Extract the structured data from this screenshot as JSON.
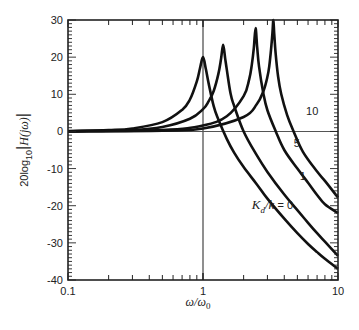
{
  "chart_data": {
    "type": "line",
    "title": "",
    "xlabel": "ω/ω0",
    "ylabel": "20log10|H(jω)|",
    "xscale": "log",
    "xlim": [
      0.1,
      10
    ],
    "ylim": [
      -40,
      30
    ],
    "x_ticks": [
      0.1,
      1,
      10
    ],
    "x_tick_labels": [
      "0.1",
      "1",
      "10"
    ],
    "y_ticks": [
      -40,
      -30,
      -20,
      -10,
      0,
      10,
      20,
      30
    ],
    "y_tick_labels": [
      "-40",
      "-30",
      "-20",
      "-10",
      "0",
      "10",
      "20",
      "30"
    ],
    "grid": false,
    "reference_lines": [
      {
        "orientation": "vertical",
        "x": 1
      },
      {
        "orientation": "horizontal",
        "y": 0
      }
    ],
    "legend": "inline labels",
    "series": [
      {
        "name": "Kd/k = 0",
        "label": "K_d/k = 0",
        "x": [
          0.1,
          0.2,
          0.3,
          0.5,
          0.7,
          0.8,
          0.9,
          0.95,
          1.0,
          1.05,
          1.1,
          1.2,
          1.3,
          1.5,
          1.7,
          2,
          2.5,
          3,
          4,
          5,
          6,
          7,
          8,
          10
        ],
        "y": [
          0.1,
          0.35,
          0.8,
          2.5,
          5.8,
          8.6,
          13.5,
          17.0,
          20.0,
          16.8,
          13.0,
          6.8,
          3.2,
          -2.0,
          -5.7,
          -9.6,
          -14.2,
          -18.1,
          -23.5,
          -27.4,
          -30.3,
          -32.5,
          -34.3,
          -37.0
        ]
      },
      {
        "name": "Kd/k = 1",
        "label": "1",
        "x": [
          0.1,
          0.3,
          0.5,
          0.8,
          1.0,
          1.1,
          1.2,
          1.3,
          1.36,
          1.41,
          1.46,
          1.5,
          1.6,
          1.7,
          2,
          2.5,
          3,
          4,
          5,
          6,
          7,
          8,
          10
        ],
        "y": [
          0.04,
          0.4,
          1.2,
          3.4,
          6.0,
          8.1,
          10.9,
          15.5,
          19.5,
          23.3,
          19.6,
          16.7,
          10.2,
          6.9,
          0.0,
          -6.4,
          -10.9,
          -17.0,
          -21.2,
          -24.6,
          -27.4,
          -29.7,
          -33.5
        ]
      },
      {
        "name": "Kd/k = 5",
        "label": "5",
        "x": [
          0.1,
          0.5,
          1.0,
          1.5,
          2.0,
          2.2,
          2.3,
          2.38,
          2.45,
          2.52,
          2.6,
          2.8,
          3.0,
          3.46,
          4,
          5,
          6,
          7,
          8,
          10
        ],
        "y": [
          0.0,
          0.4,
          1.6,
          4.1,
          9.5,
          14.1,
          18.0,
          22.5,
          27.8,
          22.6,
          17.5,
          10.2,
          5.7,
          0.0,
          -5.0,
          -10.0,
          -13.8,
          -17.1,
          -19.6,
          -22.0
        ]
      },
      {
        "name": "Kd/k = 10",
        "label": "10",
        "x": [
          0.1,
          0.5,
          1.0,
          2.0,
          2.5,
          2.8,
          3.0,
          3.1,
          3.2,
          3.27,
          3.32,
          3.37,
          3.45,
          3.6,
          3.8,
          4.2,
          4.69,
          5.5,
          7,
          8,
          10
        ],
        "y": [
          0.0,
          0.2,
          0.8,
          3.9,
          7.3,
          10.8,
          14.7,
          17.7,
          22.5,
          26.6,
          30.0,
          26.3,
          21.1,
          14.8,
          10.0,
          4.4,
          0.0,
          -5.5,
          -10.8,
          -13.3,
          -17.8
        ]
      }
    ],
    "annotations": [
      {
        "text": "10",
        "x": 5.8,
        "y": 4.5
      },
      {
        "text": "5",
        "x": 4.7,
        "y": -4.3
      },
      {
        "text": "1",
        "x": 5.2,
        "y": -13.2
      },
      {
        "text": "K_d/k = 0",
        "x": 2.3,
        "y": -20.8
      }
    ]
  }
}
